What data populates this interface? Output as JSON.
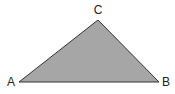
{
  "diagram": {
    "type": "triangle",
    "fill_color": "#a6a6a6",
    "stroke_color": "#333333",
    "vertices": [
      {
        "name": "A",
        "label": "A",
        "x": 19,
        "y": 82,
        "lx": 11,
        "ly": 86
      },
      {
        "name": "B",
        "label": "B",
        "x": 159,
        "y": 82,
        "lx": 166,
        "ly": 86
      },
      {
        "name": "C",
        "label": "C",
        "x": 98,
        "y": 20,
        "lx": 98,
        "ly": 14
      }
    ]
  }
}
